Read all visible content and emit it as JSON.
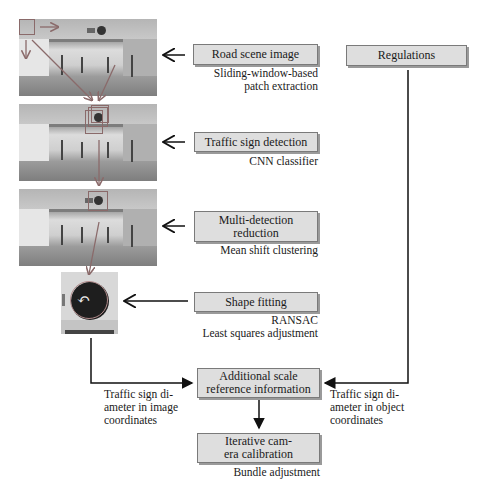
{
  "images": [
    {
      "id": "road-scene-photo",
      "caption": "Road scene photograph with sliding window"
    },
    {
      "id": "detection-photo",
      "caption": "Road scene photograph with detections"
    },
    {
      "id": "reduced-photo",
      "caption": "Road scene photograph with single detection"
    },
    {
      "id": "sign-crop",
      "caption": "Cropped traffic sign with fitted ellipse"
    }
  ],
  "steps": {
    "road_scene": {
      "label": "Road scene image",
      "note": [
        "Sliding-window-based",
        "patch extraction"
      ]
    },
    "regulations": {
      "label": "Regulations"
    },
    "detection": {
      "label": "Traffic sign detection",
      "note": [
        "CNN classifier"
      ]
    },
    "reduction": {
      "label": [
        "Multi-detection",
        "reduction"
      ],
      "note": [
        "Mean shift clustering"
      ]
    },
    "shape": {
      "label": "Shape fitting",
      "note": [
        "RANSAC",
        "Least squares adjustment"
      ]
    },
    "scale": {
      "label": [
        "Additional scale",
        "reference information"
      ]
    },
    "calibration": {
      "label": [
        "Iterative cam-",
        "era calibration"
      ],
      "note": [
        "Bundle adjustment"
      ]
    }
  },
  "edge_labels": {
    "image_diameter": [
      "Traffic sign di-",
      "ameter in image",
      "coordinates"
    ],
    "object_diameter": [
      "Traffic sign di-",
      "ameter in object",
      "coordinates"
    ]
  },
  "colors": {
    "box_fill": "#dedede",
    "box_border": "#7a7a7a",
    "arrow": "#111111",
    "photo_arrow": "#8a6a6a"
  }
}
